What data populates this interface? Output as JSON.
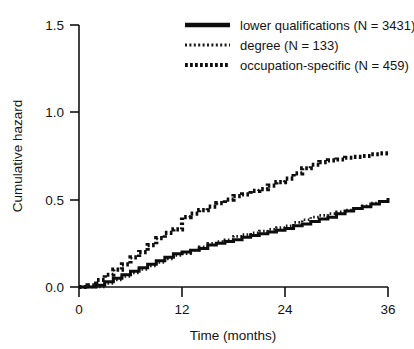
{
  "chart_data": {
    "type": "line",
    "title": "",
    "subtitle": "",
    "xlabel": "Time (months)",
    "ylabel": "Cumulative hazard",
    "xlim": [
      0,
      36
    ],
    "ylim": [
      0.0,
      1.5
    ],
    "xticks": [
      "0",
      "12",
      "24",
      "36"
    ],
    "xtick_values": [
      0,
      12,
      24,
      36
    ],
    "yticks": [
      "0.0",
      "0.5",
      "1.0",
      "1.5"
    ],
    "ytick_values": [
      0.0,
      0.5,
      1.0,
      1.5
    ],
    "grid": false,
    "legend_position": "top-right",
    "x": [
      0,
      1,
      2,
      3,
      4,
      5,
      6,
      7,
      8,
      9,
      10,
      11,
      12,
      13,
      14,
      15,
      16,
      17,
      18,
      19,
      20,
      21,
      22,
      23,
      24,
      25,
      26,
      27,
      28,
      29,
      30,
      31,
      32,
      33,
      34,
      35,
      36
    ],
    "series": [
      {
        "name": "lower qualifications (N = 3431)",
        "label": "lower qualifications",
        "n": 3431,
        "style": "solid",
        "values": [
          0.0,
          0.0,
          0.01,
          0.03,
          0.05,
          0.07,
          0.09,
          0.11,
          0.13,
          0.15,
          0.17,
          0.19,
          0.2,
          0.21,
          0.22,
          0.24,
          0.25,
          0.26,
          0.27,
          0.285,
          0.295,
          0.305,
          0.315,
          0.325,
          0.335,
          0.35,
          0.36,
          0.375,
          0.39,
          0.4,
          0.42,
          0.435,
          0.45,
          0.46,
          0.475,
          0.49,
          0.51
        ]
      },
      {
        "name": "degree (N = 133)",
        "label": "degree",
        "n": 133,
        "style": "fine-dotted",
        "values": [
          0.0,
          0.0,
          0.0,
          0.02,
          0.04,
          0.06,
          0.08,
          0.1,
          0.12,
          0.14,
          0.16,
          0.18,
          0.19,
          0.21,
          0.23,
          0.25,
          0.26,
          0.27,
          0.29,
          0.3,
          0.31,
          0.32,
          0.33,
          0.34,
          0.35,
          0.37,
          0.385,
          0.4,
          0.41,
          0.42,
          0.43,
          0.44,
          0.45,
          0.465,
          0.48,
          0.49,
          0.5
        ]
      },
      {
        "name": "occupation-specific (N = 459)",
        "label": "occupation-specific",
        "n": 459,
        "style": "bold-dotted",
        "values": [
          0.0,
          0.01,
          0.04,
          0.07,
          0.1,
          0.13,
          0.17,
          0.2,
          0.24,
          0.28,
          0.31,
          0.33,
          0.4,
          0.42,
          0.44,
          0.46,
          0.48,
          0.5,
          0.52,
          0.53,
          0.55,
          0.56,
          0.58,
          0.6,
          0.62,
          0.65,
          0.68,
          0.7,
          0.715,
          0.725,
          0.73,
          0.74,
          0.745,
          0.75,
          0.76,
          0.765,
          0.77
        ]
      }
    ]
  },
  "legend": {
    "entries": [
      {
        "label": "lower qualifications (N = 3431)",
        "swatch": "solid-line-swatch"
      },
      {
        "label": "degree (N = 133)",
        "swatch": "fine-dotted-line-swatch"
      },
      {
        "label": "occupation-specific (N = 459)",
        "swatch": "bold-dotted-line-swatch"
      }
    ]
  },
  "colors": {
    "background": "#ffffff",
    "ink": "#121212",
    "series_lower_qualifications": "#0d0d0d",
    "series_degree": "#1a1a1a",
    "series_occupation_specific": "#0d0d0d"
  }
}
